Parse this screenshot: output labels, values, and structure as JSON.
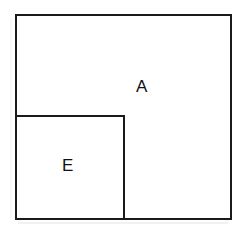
{
  "diagram": {
    "type": "geometric-region-diagram",
    "canvas": {
      "width": 246,
      "height": 234,
      "background_color": "#ffffff"
    },
    "stroke": {
      "color": "#1a1a1a",
      "width_px": 2,
      "style": "solid"
    },
    "regions": [
      {
        "id": "A",
        "label": "A",
        "role": "outer-rectangle",
        "x": 15,
        "y": 14,
        "width": 217,
        "height": 206,
        "fill": "none",
        "label_position": {
          "x": 143,
          "y": 86
        }
      },
      {
        "id": "E",
        "label": "E",
        "role": "inner-rectangle",
        "x": 15,
        "y": 115,
        "width": 110,
        "height": 105,
        "fill": "none",
        "shares_edges_with": "A",
        "shared_edges": [
          "left",
          "bottom"
        ],
        "label_position": {
          "x": 69,
          "y": 165
        }
      }
    ]
  }
}
